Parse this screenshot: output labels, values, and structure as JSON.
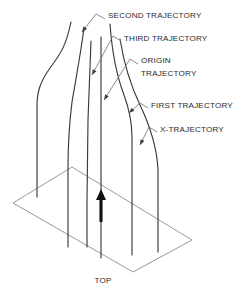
{
  "figure": {
    "background_color": "#ffffff",
    "curve_color": "#3a3a3a",
    "base_color": "#8c8c8c",
    "leader_color": "#6e6e6e",
    "arrow_color": "#111111",
    "text_color": "#2b2b2b"
  },
  "callouts": [
    {
      "id": "second-trajectory",
      "label": "SECOND TRAJECTORY",
      "lines": [
        "SECOND TRAJECTORY"
      ],
      "text_x": 108,
      "text_y": 16,
      "leader_path": "M 105 19 L 96 14",
      "pointer_path": "M 96 14 L 82 32",
      "head_x": 82,
      "head_y": 32,
      "head_angle": 128
    },
    {
      "id": "third-trajectory",
      "label": "THIRD TRAJECTORY",
      "lines": [
        "THIRD TRAJECTORY"
      ],
      "text_x": 124,
      "text_y": 39,
      "leader_path": "M 121 41 L 113 36",
      "pointer_path": "M 113 36 L 92 75",
      "head_x": 92,
      "head_y": 75,
      "head_angle": 118
    },
    {
      "id": "origin-trajectory",
      "label": "ORIGIN TRAJECTORY",
      "lines": [
        "ORIGIN",
        "TRAJECTORY"
      ],
      "text_x": 141,
      "text_y": 61,
      "leader_path": "M 138 64 L 130 59",
      "pointer_path": "M 130 59 L 104 100",
      "head_x": 104,
      "head_y": 100,
      "head_angle": 123
    },
    {
      "id": "first-trajectory",
      "label": "FIRST TRAJECTORY",
      "lines": [
        "FIRST TRAJECTORY"
      ],
      "text_x": 151,
      "text_y": 106,
      "leader_path": "M 148 108 L 140 103",
      "pointer_path": "M 140 103 L 129 113",
      "head_x": 129,
      "head_y": 113,
      "head_angle": 137
    },
    {
      "id": "x-trajectory",
      "label": "X-TRAJECTORY",
      "lines": [
        "X-TRAJECTORY"
      ],
      "text_x": 160,
      "text_y": 130,
      "leader_path": "M 157 132 L 149 127",
      "pointer_path": "M 149 127 L 140 145",
      "head_x": 140,
      "head_y": 145,
      "head_angle": 117
    }
  ],
  "trajectories": [
    {
      "id": "left-x-trajectory",
      "name": "x-trajectory-left",
      "path": "M 71 22 C 66 45, 62 52, 50 68 C 40 82, 37 92, 37 106 L 37 197"
    },
    {
      "id": "second-trajectory-curve",
      "name": "second-trajectory",
      "path": "M 84 28 C 80 58, 76 78, 72 102 C 69 126, 68 146, 68 168 L 68 247"
    },
    {
      "id": "third-trajectory-line",
      "name": "third-trajectory",
      "path": "M 91 41 L 88 120 L 87 200 L 87 247"
    },
    {
      "id": "origin-trajectory-line",
      "name": "origin-trajectory",
      "path": "M 101 37 L 101 130 L 101 210 L 101 258"
    },
    {
      "id": "first-trajectory-curve",
      "name": "first-trajectory",
      "path": "M 110 24 C 112 52, 116 74, 124 95 C 130 111, 132 124, 132 138 L 132 255"
    },
    {
      "id": "right-x-trajectory",
      "name": "x-trajectory-right",
      "path": "M 120 39 C 124 64, 130 84, 140 105 C 151 128, 157 148, 158 170 L 158 252"
    }
  ],
  "base_plane": {
    "id": "top-plane",
    "vertices": [
      {
        "x": 13,
        "y": 203
      },
      {
        "x": 72,
        "y": 167
      },
      {
        "x": 192,
        "y": 240
      },
      {
        "x": 133,
        "y": 272
      }
    ],
    "path": "M 13 203 L 72 167 L 192 240 L 133 272 Z",
    "label": "TOP",
    "label_x": 103,
    "label_y": 281
  },
  "flow_arrow": {
    "id": "flow-direction-arrow",
    "label": "upward flow direction",
    "shaft_path": "M 101 222 L 101 197",
    "head_path": "M 101 189 L 96 200 L 106 200 Z"
  }
}
